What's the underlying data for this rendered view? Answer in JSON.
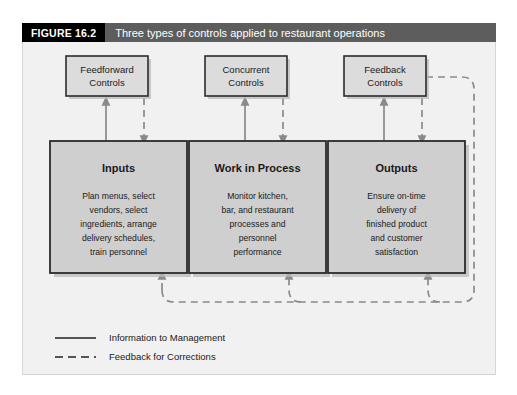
{
  "figure": {
    "number_label": "FIGURE 16.2",
    "title": "Three types of controls applied to restaurant operations"
  },
  "controls": [
    {
      "id": "feedforward",
      "line1": "Feedforward",
      "line2": "Controls"
    },
    {
      "id": "concurrent",
      "line1": "Concurrent",
      "line2": "Controls"
    },
    {
      "id": "feedback",
      "line1": "Feedback",
      "line2": "Controls"
    }
  ],
  "stages": [
    {
      "id": "inputs",
      "title": "Inputs",
      "body_lines": [
        "Plan menus, select",
        "vendors, select",
        "ingredients, arrange",
        "delivery schedules,",
        "train personnel"
      ]
    },
    {
      "id": "work-in-process",
      "title": "Work in Process",
      "body_lines": [
        "Monitor kitchen,",
        "bar, and restaurant",
        "processes and",
        "personnel",
        "performance"
      ]
    },
    {
      "id": "outputs",
      "title": "Outputs",
      "body_lines": [
        "Ensure on-time",
        "delivery of",
        "finished product",
        "and customer",
        "satisfaction"
      ]
    }
  ],
  "legend": [
    {
      "id": "information-to-management",
      "style": "solid",
      "label": "Information to Management"
    },
    {
      "id": "feedback-for-corrections",
      "style": "dashed",
      "label": "Feedback for Corrections"
    }
  ],
  "colors": {
    "header_number_bg": "#000000",
    "header_title_bg": "#5d5d5d",
    "panel_bg": "#f1f1f1",
    "control_box_fill": "#dcdcdc",
    "stage_box_fill": "#cfcfcf",
    "box_border": "#2b2b2b",
    "connector": "#8a8a8a"
  }
}
